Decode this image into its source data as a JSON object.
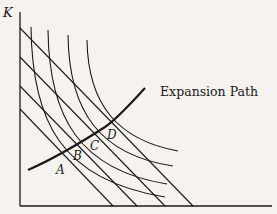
{
  "diagram": {
    "y_axis_label": "K",
    "x_axis_label": "",
    "expansion_path_label": "Expansion Path",
    "points": [
      {
        "id": "A",
        "label": "A"
      },
      {
        "id": "B",
        "label": "B"
      },
      {
        "id": "C",
        "label": "C"
      },
      {
        "id": "D",
        "label": "D"
      }
    ],
    "isoquant_count": 4,
    "isocost_line_count": 4,
    "colors": {
      "ink": "#1a1a1a",
      "paper": "#f4f3ef"
    }
  }
}
